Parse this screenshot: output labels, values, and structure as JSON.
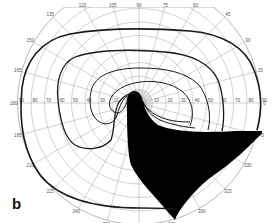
{
  "figure": {
    "panel_label": "b",
    "type": "Goldmann visual field perimetry chart",
    "center": {
      "x": 139,
      "y": 103
    },
    "scale_px_per_degree": 1.35,
    "ring_degrees": [
      10,
      20,
      30,
      40,
      50,
      60,
      70,
      80,
      90
    ],
    "meridian_labels": [
      {
        "angle": 0,
        "label": "0"
      },
      {
        "angle": 15,
        "label": "15"
      },
      {
        "angle": 30,
        "label": "30"
      },
      {
        "angle": 45,
        "label": "45"
      },
      {
        "angle": 60,
        "label": "60"
      },
      {
        "angle": 75,
        "label": "75"
      },
      {
        "angle": 90,
        "label": "90"
      },
      {
        "angle": 105,
        "label": "105"
      },
      {
        "angle": 120,
        "label": "120"
      },
      {
        "angle": 135,
        "label": "135"
      },
      {
        "angle": 150,
        "label": "150"
      },
      {
        "angle": 165,
        "label": "165"
      },
      {
        "angle": 180,
        "label": "180"
      },
      {
        "angle": 195,
        "label": "195"
      },
      {
        "angle": 210,
        "label": "210"
      },
      {
        "angle": 225,
        "label": "225"
      },
      {
        "angle": 240,
        "label": "240"
      },
      {
        "angle": 255,
        "label": "255"
      },
      {
        "angle": 270,
        "label": "270"
      },
      {
        "angle": 285,
        "label": "285"
      },
      {
        "angle": 300,
        "label": "300"
      },
      {
        "angle": 315,
        "label": "315"
      },
      {
        "angle": 330,
        "label": "330"
      },
      {
        "angle": 345,
        "label": "345"
      }
    ],
    "horizontal_axis_ticks": [
      "90",
      "80",
      "70",
      "60",
      "50",
      "40",
      "30",
      "20",
      "10",
      "10",
      "20",
      "30",
      "40",
      "50",
      "60",
      "70",
      "80",
      "90"
    ],
    "isopters": [
      {
        "name": "outer-isopter",
        "stroke_width": 1.6
      },
      {
        "name": "middle-isopter",
        "stroke_width": 1.3
      },
      {
        "name": "inner-isopter",
        "stroke_width": 1.0
      }
    ],
    "scotoma": {
      "name": "inferior-arcuate-defect",
      "fill": "#000000"
    },
    "colors": {
      "grid": "#9a9a9a",
      "isopter": "#1a1a1a",
      "label": "#555555",
      "background": "#ffffff"
    }
  }
}
